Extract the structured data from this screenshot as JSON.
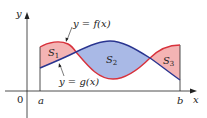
{
  "figure": {
    "axes": {
      "x_label": "x",
      "y_label": "y",
      "origin_label": "0"
    },
    "bounds": {
      "a_label": "a",
      "b_label": "b"
    },
    "curves": {
      "f_label": "y = f(x)",
      "g_label": "y = g(x)",
      "f_color": "#d8323c",
      "g_color": "#2a3590"
    },
    "regions": [
      {
        "label": "S",
        "sub": "1",
        "fill": "#f4b4b4",
        "description": "f above g"
      },
      {
        "label": "S",
        "sub": "2",
        "fill": "#a9b9e6",
        "description": "g above f"
      },
      {
        "label": "S",
        "sub": "3",
        "fill": "#f4b4b4",
        "description": "f above g"
      }
    ],
    "colors": {
      "axis": "#222222",
      "region_f_above": "#f4b4b4",
      "region_g_above": "#a9b9e6"
    }
  }
}
